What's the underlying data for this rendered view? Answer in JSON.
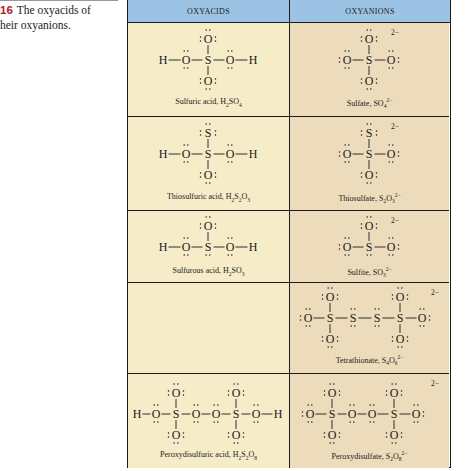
{
  "caption": {
    "figure_number": "16",
    "text": "The oxyacids of their oxyanions.",
    "line1": "The oxyacids of",
    "line2_prefix": "heir oxyanions."
  },
  "table": {
    "headers": {
      "acids": "OXYACIDS",
      "anions": "OXYANIONS"
    },
    "colors": {
      "header": "#9cc3e4",
      "acid_cell": "#f6ecc8",
      "anion_cell": "#eddcbc"
    },
    "rows": [
      {
        "acid": {
          "name": "Sulfuric acid,",
          "formula": "H",
          "f1": "2",
          "f2": "SO",
          "f3": "4",
          "f4": ""
        },
        "anion": {
          "name": "Sulfate,",
          "formula": "SO",
          "f1": "4",
          "f2": "2−",
          "charge": "2−"
        }
      },
      {
        "acid": {
          "name": "Thiosulfuric acid,",
          "formula": "H",
          "f1": "2",
          "f2": "S",
          "f3": "2",
          "f4": "O",
          "f5": "3"
        },
        "anion": {
          "name": "Thiosulfate,",
          "formula": "S",
          "f1": "2",
          "f2": "O",
          "f3": "3",
          "f4": "2−",
          "charge": "2−"
        }
      },
      {
        "acid": {
          "name": "Sulfurous acid,",
          "formula": "H",
          "f1": "2",
          "f2": "SO",
          "f3": "3"
        },
        "anion": {
          "name": "Sulfite,",
          "formula": "SO",
          "f1": "3",
          "f2": "2−",
          "charge": "2−"
        }
      },
      {
        "acid": null,
        "anion": {
          "name": "Tetrathionate,",
          "formula": "S",
          "f1": "4",
          "f2": "O",
          "f3": "6",
          "f4": "2−",
          "charge": "2−"
        }
      },
      {
        "acid": {
          "name": "Peroxydisulfuric acid,",
          "formula": "H",
          "f1": "2",
          "f2": "S",
          "f3": "2",
          "f4": "O",
          "f5": "8"
        },
        "anion": {
          "name": "Peroxydisulfate,",
          "formula": "S",
          "f1": "2",
          "f2": "O",
          "f3": "8",
          "f4": "2−",
          "charge": "2−"
        }
      }
    ]
  },
  "atoms": {
    "H": "H",
    "O": "O",
    "S": "S"
  }
}
